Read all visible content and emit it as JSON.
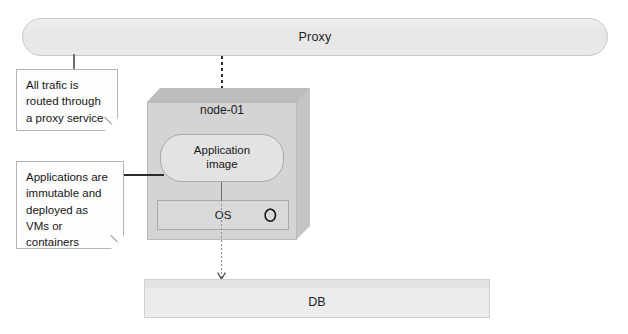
{
  "diagram": {
    "colors": {
      "box_fill": "#d4d4d4",
      "pill_fill": "#e6e6e6",
      "note_fill": "#fdfdfd",
      "line": "#2b2b2b"
    },
    "proxy": {
      "label": "Proxy"
    },
    "node": {
      "label": "node-01",
      "application": {
        "line1": "Application",
        "line2": "image"
      },
      "os": {
        "label": "OS",
        "icon": "power-ring-icon"
      }
    },
    "database": {
      "label": "DB"
    },
    "notes": [
      {
        "id": "traffic-note",
        "text": "All trafic is routed through a proxy service"
      },
      {
        "id": "applications-note",
        "text": "Applications are immutable and deployed as VMs or containers"
      }
    ],
    "connectors": [
      {
        "id": "proxy-to-app",
        "style": "dashed",
        "arrow": "filled",
        "from": "Proxy",
        "to": "Application image"
      },
      {
        "id": "app-to-os",
        "style": "solid",
        "arrow": "none",
        "from": "Application image",
        "to": "OS"
      },
      {
        "id": "os-to-db",
        "style": "dotted",
        "arrow": "open",
        "from": "OS",
        "to": "DB"
      },
      {
        "id": "proxy-to-traffic-note",
        "style": "solid",
        "arrow": "none",
        "from": "Proxy",
        "to": "All trafic is routed through a proxy service"
      },
      {
        "id": "apps-note-to-app",
        "style": "solid",
        "arrow": "none",
        "from": "Applications are immutable and deployed as VMs or containers",
        "to": "Application image"
      }
    ]
  }
}
